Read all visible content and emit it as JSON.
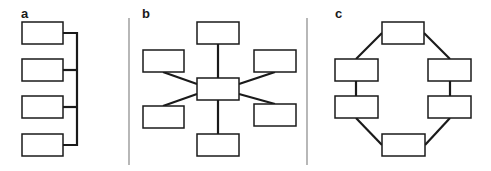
{
  "panels": [
    {
      "id": "a",
      "label": "a",
      "topology": "bus"
    },
    {
      "id": "b",
      "label": "b",
      "topology": "star"
    },
    {
      "id": "c",
      "label": "c",
      "topology": "ring"
    }
  ],
  "colors": {
    "stroke": "#1a1a1a",
    "divider": "#888888",
    "background": "#ffffff"
  }
}
